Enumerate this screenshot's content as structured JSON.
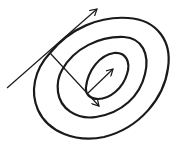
{
  "diagram": {
    "type": "contour-gradient-sketch",
    "background": "#ffffff",
    "stroke_color": "#1a1a1a",
    "contours": [
      {
        "name": "outer",
        "path": "M 50 53 C 70 28, 100 16, 128 18 C 158 20, 172 42, 168 68 C 164 98, 140 128, 104 137 C 76 143, 48 132, 38 110 C 30 92, 34 70, 50 53 Z",
        "stroke_width": 2.2
      },
      {
        "name": "middle",
        "path": "M 62 70 C 74 48, 100 36, 124 37 C 142 38, 150 54, 145 74 C 140 96, 122 113, 96 117 C 76 120, 60 108, 58 92 C 57 84, 58 77, 62 70 Z",
        "stroke_width": 2.2
      },
      {
        "name": "inner",
        "path": "M 86 87 C 88 70, 100 55, 114 53 C 126 52, 131 62, 127 74 C 123 88, 110 99, 98 99 C 90 99, 85 94, 86 87 Z",
        "stroke_width": 2.2
      }
    ],
    "arrows": [
      {
        "name": "tangent-arrow",
        "x1": 7,
        "y1": 88,
        "x2": 97,
        "y2": 9,
        "stroke_width": 1.2
      },
      {
        "name": "normal-arrow",
        "x1": 50,
        "y1": 53,
        "x2": 99,
        "y2": 106,
        "stroke_width": 1.2
      },
      {
        "name": "inner-gradient-arrow",
        "x1": 88,
        "y1": 93,
        "x2": 113,
        "y2": 69,
        "stroke_width": 1.2
      }
    ]
  }
}
